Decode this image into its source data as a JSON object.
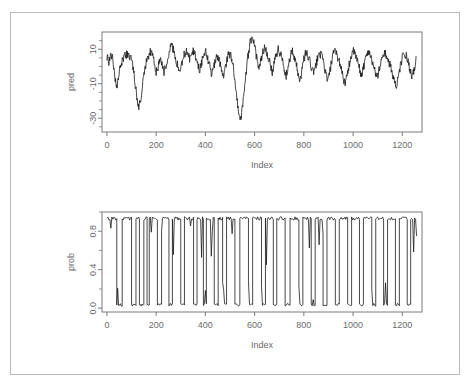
{
  "figure": {
    "background_color": "#ffffff",
    "frame_color": "#b9b9b9",
    "line_color": "#1a1a1a",
    "axis_color": "#7a7a7a",
    "tick_label_color": "#6b6b6b",
    "caption": ""
  },
  "chart_data": [
    {
      "type": "line",
      "name": "pred-panel",
      "title": "",
      "xlabel": "Index",
      "ylabel": "pred",
      "xlim": [
        -20,
        1280
      ],
      "ylim": [
        -38,
        20
      ],
      "xticks": [
        0,
        200,
        400,
        600,
        800,
        1000,
        1200
      ],
      "xticklabels": [
        "0",
        "200",
        "400",
        "600",
        "800",
        "1000",
        "1200"
      ],
      "yticks": [
        -30,
        -10,
        10
      ],
      "yticklabels": [
        "-30",
        "-10",
        "10"
      ],
      "grid": false,
      "legend": "none",
      "series": [
        {
          "name": "pred",
          "x": [
            0,
            8,
            16,
            24,
            32,
            40,
            48,
            56,
            64,
            72,
            80,
            88,
            96,
            104,
            112,
            120,
            128,
            136,
            144,
            152,
            160,
            168,
            176,
            184,
            192,
            200,
            208,
            216,
            224,
            232,
            240,
            248,
            256,
            264,
            272,
            280,
            288,
            296,
            304,
            312,
            320,
            328,
            336,
            344,
            352,
            360,
            368,
            376,
            384,
            392,
            400,
            408,
            416,
            424,
            432,
            440,
            448,
            456,
            464,
            472,
            480,
            488,
            496,
            504,
            512,
            520,
            528,
            536,
            544,
            552,
            560,
            568,
            576,
            584,
            592,
            600,
            608,
            616,
            624,
            632,
            640,
            648,
            656,
            664,
            672,
            680,
            688,
            696,
            704,
            712,
            720,
            728,
            736,
            744,
            752,
            760,
            768,
            776,
            784,
            792,
            800,
            808,
            816,
            824,
            832,
            840,
            848,
            856,
            864,
            872,
            880,
            888,
            896,
            904,
            912,
            920,
            928,
            936,
            944,
            952,
            960,
            968,
            976,
            984,
            992,
            1000,
            1008,
            1016,
            1024,
            1032,
            1040,
            1048,
            1056,
            1064,
            1072,
            1080,
            1088,
            1096,
            1104,
            1112,
            1120,
            1128,
            1136,
            1144,
            1152,
            1160,
            1168,
            1176,
            1184,
            1192,
            1200,
            1208,
            1216,
            1224,
            1232,
            1240,
            1248,
            1256
          ],
          "y": [
            6,
            3,
            7,
            5,
            -6,
            -13,
            -5,
            1,
            4,
            6,
            7,
            6,
            5,
            2,
            -7,
            -16,
            -24,
            -20,
            -11,
            -3,
            3,
            6,
            9,
            7,
            2,
            -4,
            0,
            5,
            2,
            -3,
            1,
            6,
            10,
            12,
            9,
            4,
            0,
            -4,
            1,
            6,
            9,
            7,
            4,
            6,
            9,
            6,
            2,
            -2,
            2,
            7,
            9,
            6,
            1,
            -5,
            -2,
            3,
            6,
            4,
            -1,
            -6,
            -2,
            4,
            8,
            6,
            2,
            -8,
            -18,
            -27,
            -31,
            -22,
            -10,
            0,
            9,
            15,
            18,
            12,
            5,
            -2,
            3,
            8,
            11,
            9,
            5,
            1,
            -3,
            2,
            7,
            10,
            8,
            4,
            -1,
            -5,
            -1,
            5,
            9,
            6,
            2,
            -3,
            -8,
            -3,
            4,
            8,
            6,
            3,
            -1,
            -4,
            0,
            5,
            8,
            6,
            2,
            -3,
            -9,
            -4,
            2,
            7,
            9,
            6,
            3,
            -1,
            -6,
            -11,
            -5,
            1,
            6,
            9,
            7,
            4,
            0,
            -5,
            -2,
            3,
            7,
            9,
            6,
            2,
            -2,
            -7,
            -3,
            2,
            6,
            8,
            6,
            3,
            0,
            -4,
            -8,
            -13,
            -6,
            0,
            5,
            8,
            6,
            2,
            -3,
            -7,
            -2,
            4,
            7,
            5,
            1,
            -4,
            -9,
            -14,
            -8,
            -2,
            4,
            8,
            6
          ]
        }
      ]
    },
    {
      "type": "line",
      "name": "prob-panel",
      "title": "",
      "xlabel": "Index",
      "ylabel": "prob",
      "xlim": [
        -20,
        1280
      ],
      "ylim": [
        -0.04,
        1.0
      ],
      "xticks": [
        0,
        200,
        400,
        600,
        800,
        1000,
        1200
      ],
      "xticklabels": [
        "0",
        "200",
        "400",
        "600",
        "800",
        "1000",
        "1200"
      ],
      "yticks": [
        0.0,
        0.4,
        0.8
      ],
      "yticklabels": [
        "0.0",
        "0.4",
        "0.8"
      ],
      "grid": false,
      "legend": "none",
      "series": [
        {
          "name": "prob",
          "high_level": 0.95,
          "low_level": 0.02,
          "segments": [
            [
              0,
              40,
              "high"
            ],
            [
              40,
              62,
              "low"
            ],
            [
              62,
              100,
              "high"
            ],
            [
              100,
              118,
              "low"
            ],
            [
              118,
              132,
              "high"
            ],
            [
              132,
              150,
              "low"
            ],
            [
              150,
              163,
              "high"
            ],
            [
              163,
              172,
              "low"
            ],
            [
              172,
              205,
              "high"
            ],
            [
              205,
              222,
              "low"
            ],
            [
              222,
              252,
              "high"
            ],
            [
              252,
              266,
              "low"
            ],
            [
              266,
              300,
              "high"
            ],
            [
              300,
              315,
              "low"
            ],
            [
              315,
              352,
              "high"
            ],
            [
              352,
              366,
              "low"
            ],
            [
              366,
              392,
              "high"
            ],
            [
              392,
              404,
              "low"
            ],
            [
              404,
              436,
              "high"
            ],
            [
              436,
              452,
              "low"
            ],
            [
              452,
              470,
              "high"
            ],
            [
              470,
              486,
              "low"
            ],
            [
              486,
              520,
              "high"
            ],
            [
              520,
              540,
              "low"
            ],
            [
              540,
              575,
              "high"
            ],
            [
              575,
              592,
              "low"
            ],
            [
              592,
              628,
              "high"
            ],
            [
              628,
              644,
              "low"
            ],
            [
              644,
              676,
              "high"
            ],
            [
              676,
              690,
              "low"
            ],
            [
              690,
              724,
              "high"
            ],
            [
              724,
              744,
              "low"
            ],
            [
              744,
              780,
              "high"
            ],
            [
              780,
              796,
              "low"
            ],
            [
              796,
              830,
              "high"
            ],
            [
              830,
              846,
              "low"
            ],
            [
              846,
              878,
              "high"
            ],
            [
              878,
              894,
              "low"
            ],
            [
              894,
              928,
              "high"
            ],
            [
              928,
              944,
              "low"
            ],
            [
              944,
              978,
              "high"
            ],
            [
              978,
              994,
              "low"
            ],
            [
              994,
              1026,
              "high"
            ],
            [
              1026,
              1042,
              "low"
            ],
            [
              1042,
              1076,
              "high"
            ],
            [
              1076,
              1092,
              "low"
            ],
            [
              1092,
              1124,
              "high"
            ],
            [
              1124,
              1140,
              "low"
            ],
            [
              1140,
              1172,
              "high"
            ],
            [
              1172,
              1188,
              "low"
            ],
            [
              1188,
              1220,
              "high"
            ],
            [
              1220,
              1234,
              "low"
            ],
            [
              1234,
              1258,
              "high"
            ]
          ]
        }
      ]
    }
  ],
  "panels": {
    "top": {
      "ylabel": "pred",
      "xlabel": "Index",
      "yticklabels": [
        "-30",
        "-10",
        "10"
      ],
      "xticklabels": [
        "0",
        "200",
        "400",
        "600",
        "800",
        "1000",
        "1200"
      ]
    },
    "bottom": {
      "ylabel": "prob",
      "xlabel": "Index",
      "yticklabels": [
        "0.0",
        "0.4",
        "0.8"
      ],
      "xticklabels": [
        "0",
        "200",
        "400",
        "600",
        "800",
        "1000",
        "1200"
      ]
    }
  }
}
